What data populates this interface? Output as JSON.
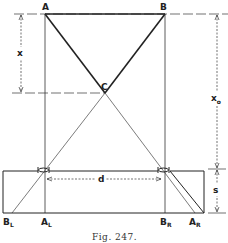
{
  "figure": {
    "caption": "Fig. 247.",
    "points": {
      "A": "A",
      "B": "B",
      "C": "C"
    },
    "bottom_labels": {
      "B_L": {
        "main": "B",
        "sub": "L"
      },
      "A_L": {
        "main": "A",
        "sub": "L"
      },
      "B_R": {
        "main": "B",
        "sub": "R"
      },
      "A_R": {
        "main": "A",
        "sub": "R"
      }
    },
    "dimensions": {
      "x": "x",
      "x0": {
        "main": "x",
        "sub": "o"
      },
      "d": "d",
      "s": "s"
    }
  }
}
